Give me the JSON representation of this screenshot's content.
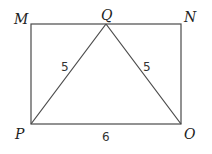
{
  "diagram": {
    "type": "geometry",
    "stroke_color": "#4a4a4a",
    "points": {
      "M": {
        "label": "M",
        "x": 31,
        "y": 24
      },
      "Q": {
        "label": "Q",
        "x": 106,
        "y": 24
      },
      "N": {
        "label": "N",
        "x": 181,
        "y": 24
      },
      "P": {
        "label": "P",
        "x": 31,
        "y": 124
      },
      "O": {
        "label": "O",
        "x": 181,
        "y": 124
      }
    },
    "segments": [
      {
        "from": "M",
        "to": "N"
      },
      {
        "from": "N",
        "to": "O"
      },
      {
        "from": "O",
        "to": "P"
      },
      {
        "from": "P",
        "to": "M"
      },
      {
        "from": "P",
        "to": "Q"
      },
      {
        "from": "Q",
        "to": "O"
      }
    ],
    "measurements": {
      "PQ": "5",
      "QO": "5",
      "PO": "6"
    }
  }
}
